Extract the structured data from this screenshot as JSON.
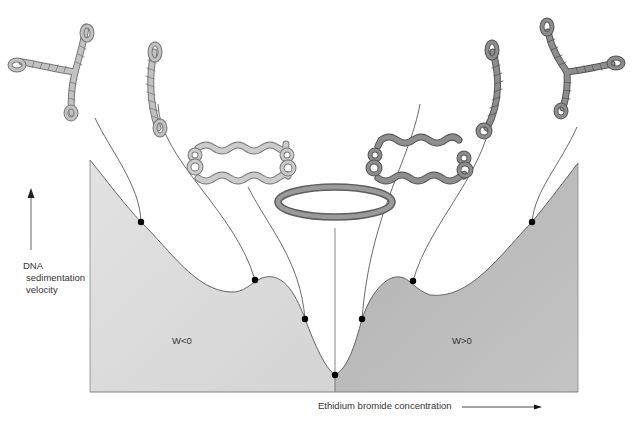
{
  "diagram": {
    "axes": {
      "y_label_lines": [
        "DNA",
        "sedimentation",
        "velocity"
      ],
      "x_label": "Ethidium bromide concentration",
      "y_arrow": "up",
      "x_arrow": "right"
    },
    "regions": [
      {
        "label": "W<0",
        "color": "#dcdcdc"
      },
      {
        "label": "W>0",
        "color": "#b9b9b9"
      }
    ],
    "structures": [
      {
        "name": "negatively-branched-supercoil",
        "color": "#bdbdbd"
      },
      {
        "name": "negatively-plectonemic-supercoil",
        "color": "#bdbdbd"
      },
      {
        "name": "negatively-partially-relaxed-circle",
        "color": "#c8c8c8"
      },
      {
        "name": "relaxed-circle",
        "color": "#8a8a8a"
      },
      {
        "name": "positively-partially-relaxed-circle",
        "color": "#8e8e8e"
      },
      {
        "name": "positively-plectonemic-supercoil",
        "color": "#8e8e8e"
      },
      {
        "name": "positively-branched-supercoil",
        "color": "#8e8e8e"
      }
    ],
    "curve_points": [
      {
        "x": 141,
        "y": 222
      },
      {
        "x": 255,
        "y": 280
      },
      {
        "x": 305,
        "y": 319
      },
      {
        "x": 335,
        "y": 375
      },
      {
        "x": 362,
        "y": 319
      },
      {
        "x": 413,
        "y": 281
      },
      {
        "x": 532,
        "y": 222
      }
    ]
  }
}
